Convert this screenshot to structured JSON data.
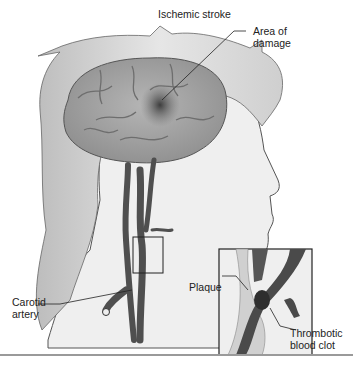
{
  "title": "Ischemic stroke",
  "labels": {
    "damage_line1": "Area of",
    "damage_line2": "damage",
    "plaque": "Plaque",
    "carotid_line1": "Carotid",
    "carotid_line2": "artery",
    "clot_line1": "Thrombotic",
    "clot_line2": "blood clot"
  },
  "colors": {
    "skin": "#ededed",
    "hair": "#d4d4d4",
    "brain": "#a9a9a9",
    "vessel": "#555555",
    "outline": "#333333"
  }
}
